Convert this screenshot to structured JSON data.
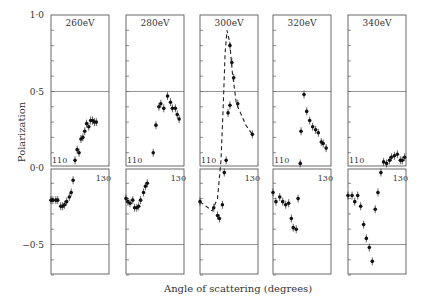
{
  "chart_data": {
    "type": "scatter",
    "title": "",
    "xlabel": "Angle of scattering (degrees)",
    "ylabel": "Polarization",
    "ylim": [
      -0.69,
      1.0
    ],
    "xlim": [
      110,
      131.5
    ],
    "y_ticks": [
      {
        "value": 1.0,
        "label": "1·0"
      },
      {
        "value": 0.5,
        "label": "0·5"
      },
      {
        "value": 0.0,
        "label": "0·0"
      },
      {
        "value": -0.5,
        "label": "−0·5"
      }
    ],
    "x_tick_labels": [
      "110",
      "130"
    ],
    "reference_lines": [
      0.5,
      -0.5
    ],
    "grid": false,
    "panels": [
      {
        "label": "260eV",
        "x": [
          110.0,
          110.7,
          111.8,
          112.5,
          113.6,
          114.3,
          115.0,
          115.8,
          116.8,
          117.5,
          118.2,
          118.9,
          119.7,
          120.4,
          121.1,
          121.8,
          122.5,
          123.2,
          124.0,
          124.7,
          125.4,
          126.1,
          126.8
        ],
        "y": [
          -0.21,
          -0.21,
          -0.21,
          -0.21,
          -0.25,
          -0.25,
          -0.24,
          -0.22,
          -0.19,
          -0.16,
          -0.08,
          0.05,
          0.12,
          0.1,
          0.19,
          0.2,
          0.24,
          0.29,
          0.27,
          0.31,
          0.31,
          0.3,
          0.3
        ],
        "curve": null
      },
      {
        "label": "280eV",
        "x": [
          110.0,
          110.7,
          111.5,
          112.5,
          113.2,
          114.0,
          114.7,
          115.4,
          116.5,
          117.2,
          117.9,
          120.1,
          121.1,
          122.2,
          122.9,
          124.0,
          125.4,
          126.5,
          127.2,
          128.3,
          129.0,
          129.7
        ],
        "y": [
          -0.2,
          -0.22,
          -0.23,
          -0.21,
          -0.26,
          -0.26,
          -0.25,
          -0.21,
          -0.16,
          -0.12,
          -0.1,
          0.1,
          0.28,
          0.4,
          0.42,
          0.39,
          0.47,
          0.43,
          0.39,
          0.39,
          0.35,
          0.32
        ],
        "curve": null
      },
      {
        "label": "300eV",
        "x": [
          110.0,
          115.1,
          116.5,
          117.2,
          118.3,
          119.0,
          119.7,
          120.4,
          121.1,
          121.1,
          121.8,
          122.5,
          124.0,
          129.4
        ],
        "y": [
          -0.22,
          -0.26,
          -0.31,
          -0.33,
          -0.24,
          -0.03,
          0.05,
          0.36,
          0.41,
          0.8,
          0.69,
          0.59,
          0.42,
          0.22
        ],
        "curve": {
          "style": "dashed",
          "x": [
            110.0,
            114.5,
            116.5,
            117.8,
            118.6,
            119.3,
            120.0,
            121.0,
            122.0,
            123.5,
            125.0,
            127.0,
            129.4
          ],
          "y": [
            -0.22,
            -0.28,
            -0.2,
            0.05,
            0.4,
            0.75,
            0.9,
            0.82,
            0.62,
            0.42,
            0.36,
            0.28,
            0.22
          ]
        }
      },
      {
        "label": "320eV",
        "x": [
          110.0,
          111.1,
          112.5,
          113.6,
          114.7,
          115.8,
          116.8,
          117.5,
          118.6,
          119.3,
          120.1,
          120.4,
          121.5,
          122.5,
          123.6,
          124.7,
          125.8,
          126.8,
          127.9,
          128.6,
          129.7
        ],
        "y": [
          -0.16,
          -0.22,
          -0.19,
          -0.22,
          -0.24,
          -0.23,
          -0.33,
          -0.39,
          -0.4,
          -0.2,
          0.03,
          0.24,
          0.48,
          0.37,
          0.31,
          0.27,
          0.25,
          0.23,
          0.17,
          0.16,
          0.13
        ],
        "curve": null
      },
      {
        "label": "340eV",
        "x": [
          110.0,
          111.5,
          112.5,
          113.6,
          114.7,
          115.8,
          116.8,
          117.9,
          119.0,
          120.1,
          121.1,
          122.2,
          123.2,
          124.3,
          125.4,
          126.1,
          127.2,
          128.3,
          129.4,
          130.1,
          131.0
        ],
        "y": [
          -0.18,
          -0.18,
          -0.22,
          -0.18,
          -0.25,
          -0.37,
          -0.46,
          -0.52,
          -0.61,
          -0.27,
          -0.16,
          -0.03,
          0.04,
          0.03,
          0.05,
          0.07,
          0.08,
          0.09,
          0.05,
          0.05,
          0.07
        ],
        "curve": null
      }
    ]
  }
}
